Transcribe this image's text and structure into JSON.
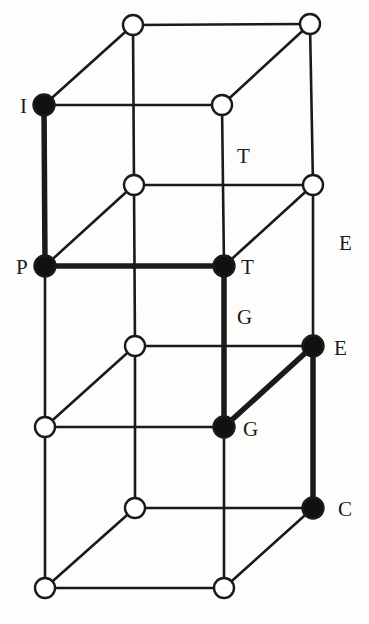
{
  "diagram": {
    "type": "lattice-graph",
    "colors": {
      "background": "#fdfdfb",
      "edge": "#1a1a1a",
      "filled_node": "#111111",
      "open_node_fill": "#ffffff"
    },
    "nodes": [
      {
        "id": "n1",
        "x": 133,
        "y": 25,
        "filled": false,
        "label": ""
      },
      {
        "id": "n2",
        "x": 310,
        "y": 24,
        "filled": false,
        "label": ""
      },
      {
        "id": "n3",
        "x": 44,
        "y": 105,
        "filled": true,
        "label": "I"
      },
      {
        "id": "n4",
        "x": 222,
        "y": 105,
        "filled": false,
        "label": ""
      },
      {
        "id": "n5",
        "x": 134,
        "y": 185,
        "filled": false,
        "label": ""
      },
      {
        "id": "n6",
        "x": 313,
        "y": 185,
        "filled": false,
        "label": ""
      },
      {
        "id": "n7",
        "x": 45,
        "y": 266,
        "filled": true,
        "label": "P"
      },
      {
        "id": "n8",
        "x": 224,
        "y": 266,
        "filled": true,
        "label": "T"
      },
      {
        "id": "n9",
        "x": 135,
        "y": 346,
        "filled": false,
        "label": ""
      },
      {
        "id": "n10",
        "x": 313,
        "y": 346,
        "filled": true,
        "label": "E"
      },
      {
        "id": "n11",
        "x": 45,
        "y": 427,
        "filled": false,
        "label": ""
      },
      {
        "id": "n12",
        "x": 224,
        "y": 427,
        "filled": true,
        "label": "G"
      },
      {
        "id": "n13",
        "x": 135,
        "y": 508,
        "filled": false,
        "label": ""
      },
      {
        "id": "n14",
        "x": 313,
        "y": 508,
        "filled": true,
        "label": "C"
      },
      {
        "id": "n15",
        "x": 45,
        "y": 588,
        "filled": false,
        "label": ""
      },
      {
        "id": "n16",
        "x": 224,
        "y": 588,
        "filled": false,
        "label": ""
      }
    ],
    "edges": [
      {
        "from": "n1",
        "to": "n2",
        "thick": false
      },
      {
        "from": "n3",
        "to": "n4",
        "thick": false
      },
      {
        "from": "n1",
        "to": "n3",
        "thick": false
      },
      {
        "from": "n2",
        "to": "n4",
        "thick": false
      },
      {
        "from": "n1",
        "to": "n5",
        "thick": false
      },
      {
        "from": "n2",
        "to": "n6",
        "thick": false
      },
      {
        "from": "n3",
        "to": "n7",
        "thick": true
      },
      {
        "from": "n4",
        "to": "n8",
        "thick": false
      },
      {
        "from": "n5",
        "to": "n6",
        "thick": false
      },
      {
        "from": "n7",
        "to": "n8",
        "thick": true
      },
      {
        "from": "n5",
        "to": "n7",
        "thick": false
      },
      {
        "from": "n6",
        "to": "n8",
        "thick": false
      },
      {
        "from": "n5",
        "to": "n9",
        "thick": false
      },
      {
        "from": "n6",
        "to": "n10",
        "thick": false
      },
      {
        "from": "n7",
        "to": "n11",
        "thick": false
      },
      {
        "from": "n8",
        "to": "n12",
        "thick": true
      },
      {
        "from": "n9",
        "to": "n10",
        "thick": false
      },
      {
        "from": "n11",
        "to": "n12",
        "thick": false
      },
      {
        "from": "n9",
        "to": "n11",
        "thick": false
      },
      {
        "from": "n10",
        "to": "n12",
        "thick": true
      },
      {
        "from": "n9",
        "to": "n13",
        "thick": false
      },
      {
        "from": "n10",
        "to": "n14",
        "thick": true
      },
      {
        "from": "n11",
        "to": "n15",
        "thick": false
      },
      {
        "from": "n12",
        "to": "n16",
        "thick": false
      },
      {
        "from": "n13",
        "to": "n14",
        "thick": false
      },
      {
        "from": "n15",
        "to": "n16",
        "thick": false
      },
      {
        "from": "n13",
        "to": "n15",
        "thick": false
      },
      {
        "from": "n14",
        "to": "n16",
        "thick": false
      }
    ],
    "labels": [
      {
        "id": "lbl-I",
        "text": "I",
        "x": 20,
        "y": 113
      },
      {
        "id": "lbl-T1",
        "text": "T",
        "x": 237,
        "y": 163
      },
      {
        "id": "lbl-E1",
        "text": "E",
        "x": 339,
        "y": 250
      },
      {
        "id": "lbl-P",
        "text": "P",
        "x": 16,
        "y": 274
      },
      {
        "id": "lbl-T2",
        "text": "T",
        "x": 241,
        "y": 274
      },
      {
        "id": "lbl-G1",
        "text": "G",
        "x": 237,
        "y": 324
      },
      {
        "id": "lbl-E2",
        "text": "E",
        "x": 334,
        "y": 355
      },
      {
        "id": "lbl-G2",
        "text": "G",
        "x": 243,
        "y": 436
      },
      {
        "id": "lbl-C",
        "text": "C",
        "x": 338,
        "y": 516
      }
    ],
    "highlighted_path": [
      "I",
      "P",
      "T",
      "G",
      "E",
      "C"
    ]
  }
}
